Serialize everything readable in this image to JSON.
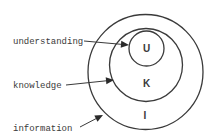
{
  "diagram": {
    "title": "",
    "circles": [
      {
        "id": "information",
        "letter": "I",
        "cx": 145.5,
        "cy": 72,
        "r": 57.5,
        "letter_x": 145,
        "letter_y": 119
      },
      {
        "id": "knowledge",
        "letter": "K",
        "cx": 146,
        "cy": 65,
        "r": 36.5,
        "letter_x": 146.5,
        "letter_y": 87
      },
      {
        "id": "understanding",
        "letter": "U",
        "cx": 146.5,
        "cy": 48.5,
        "r": 17.5,
        "letter_x": 146.5,
        "letter_y": 51.5
      }
    ],
    "labels": [
      {
        "id": "understanding",
        "text": "understanding",
        "x": 13,
        "y": 44,
        "arrow": {
          "x1": 84,
          "y1": 41,
          "x2": 129,
          "y2": 45
        }
      },
      {
        "id": "knowledge",
        "text": "knowledge",
        "x": 13,
        "y": 88,
        "arrow": {
          "x1": 66,
          "y1": 85,
          "x2": 114,
          "y2": 80
        }
      },
      {
        "id": "information",
        "text": "information",
        "x": 13,
        "y": 131,
        "arrow": {
          "x1": 80,
          "y1": 127,
          "x2": 103,
          "y2": 115
        }
      }
    ],
    "colors": {
      "stroke": "#3a3a3a",
      "text": "#3a3a3a",
      "background": "#ffffff"
    }
  }
}
